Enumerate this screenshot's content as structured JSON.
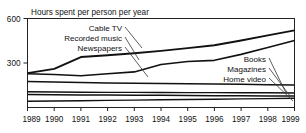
{
  "chart_data": {
    "type": "line",
    "title": "Hours spent per person per year",
    "xlabel": "",
    "ylabel": "",
    "x": [
      1989,
      1990,
      1991,
      1992,
      1993,
      1994,
      1995,
      1996,
      1997,
      1998,
      1999
    ],
    "categories": [
      "1989",
      "1990",
      "1991",
      "1992",
      "1993",
      "1994",
      "1995",
      "1996",
      "1997",
      "1998",
      "1999"
    ],
    "xlim": [
      1989,
      1999
    ],
    "ylim": [
      0,
      600
    ],
    "yticks": [
      300,
      600
    ],
    "ytick_labels": [
      "300",
      "600"
    ],
    "grid": false,
    "legend_position": "inline-annotations",
    "series": [
      {
        "name": "Cable TV",
        "label_side": "left",
        "values": [
          232,
          260,
          340,
          352,
          366,
          382,
          400,
          420,
          452,
          486,
          520
        ]
      },
      {
        "name": "Recorded music",
        "label_side": "left",
        "values": [
          228,
          222,
          214,
          228,
          240,
          290,
          310,
          318,
          358,
          404,
          452
        ]
      },
      {
        "name": "Newspapers",
        "label_side": "left",
        "values": [
          176,
          172,
          168,
          166,
          164,
          162,
          160,
          158,
          156,
          154,
          152
        ]
      },
      {
        "name": "Books",
        "label_side": "right",
        "values": [
          106,
          104,
          103,
          102,
          102,
          101,
          100,
          100,
          99,
          99,
          98
        ]
      },
      {
        "name": "Magazines",
        "label_side": "right",
        "values": [
          88,
          86,
          85,
          84,
          83,
          82,
          81,
          80,
          79,
          78,
          77
        ]
      },
      {
        "name": "Home video",
        "label_side": "right",
        "values": [
          42,
          44,
          46,
          48,
          50,
          52,
          54,
          56,
          58,
          60,
          62
        ]
      }
    ],
    "annotations_left": [
      "Cable TV",
      "Recorded music",
      "Newspapers"
    ],
    "annotations_right": [
      "Books",
      "Magazines",
      "Home video"
    ]
  }
}
